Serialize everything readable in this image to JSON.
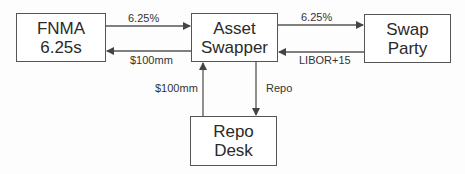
{
  "nodes": {
    "fnma": {
      "line1": "FNMA",
      "line2": "6.25s"
    },
    "asset_swapper": {
      "line1": "Asset",
      "line2": "Swapper"
    },
    "swap_party": {
      "line1": "Swap",
      "line2": "Party"
    },
    "repo_desk": {
      "line1": "Repo",
      "line2": "Desk"
    }
  },
  "edges": {
    "fnma_to_swapper": "6.25%",
    "swapper_to_fnma": "$100mm",
    "swapper_to_swap_party": "6.25%",
    "swap_party_to_swapper": "LIBOR+15",
    "repo_to_swapper": "$100mm",
    "swapper_to_repo": "Repo"
  },
  "colors": {
    "line": "#555555",
    "text": "#2a2a2a"
  }
}
